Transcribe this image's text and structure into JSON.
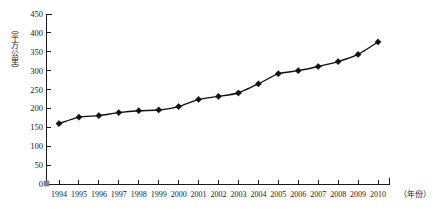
{
  "chart_data": {
    "type": "line",
    "title": "",
    "xlabel": "（年份）",
    "ylabel": "（平方公里）",
    "x": [
      1994,
      1995,
      1996,
      1997,
      1998,
      1999,
      2000,
      2001,
      2002,
      2003,
      2004,
      2005,
      2006,
      2007,
      2008,
      2009,
      2010
    ],
    "categories": [
      "1994",
      "1995",
      "1996",
      "1997",
      "1998",
      "1999",
      "2000",
      "2001",
      "2002",
      "2003",
      "2004",
      "2005",
      "2006",
      "2007",
      "2008",
      "2009",
      "2010"
    ],
    "values": [
      160,
      177,
      181,
      189,
      194,
      196,
      205,
      224,
      232,
      241,
      265,
      292,
      300,
      311,
      324,
      343,
      376
    ],
    "series": [
      {
        "name": "建成区面积",
        "values": [
          160,
          177,
          181,
          189,
          194,
          196,
          205,
          224,
          232,
          241,
          265,
          292,
          300,
          311,
          324,
          343,
          376
        ]
      }
    ],
    "ylim": [
      0,
      450
    ],
    "ytick_step": 50,
    "yticks": [
      0,
      50,
      100,
      150,
      200,
      250,
      300,
      350,
      400,
      450
    ],
    "ytick_labels": [
      "0",
      "50",
      "100",
      "150",
      "200",
      "250",
      "300",
      "350",
      "400",
      "450"
    ],
    "xtick_labels": [
      "1994",
      "1995",
      "1996",
      "1997",
      "1998",
      "1999",
      "2000",
      "2001",
      "2002",
      "2003",
      "2004",
      "2005",
      "2006",
      "2007",
      "2008",
      "2009",
      "2010"
    ],
    "grid": false,
    "legend": false,
    "legend_position": "none",
    "marker": "diamond",
    "line_color": "#111111",
    "marker_color": "#111111",
    "axis_color": "#1a1a1a",
    "background_color": "#ffffff"
  }
}
